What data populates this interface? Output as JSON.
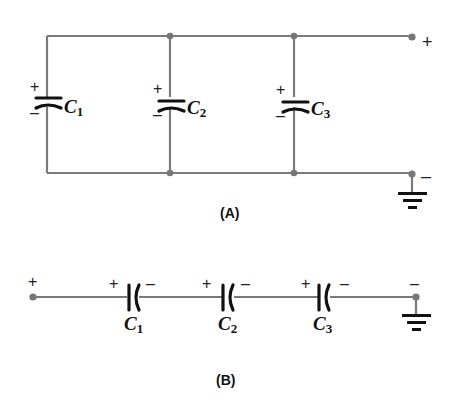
{
  "figures": [
    {
      "id": "A",
      "label": "(A)",
      "configuration": "parallel",
      "capacitors": [
        {
          "name": "C",
          "subscript": "1",
          "plus": "+",
          "minus": "–"
        },
        {
          "name": "C",
          "subscript": "2",
          "plus": "+",
          "minus": "–"
        },
        {
          "name": "C",
          "subscript": "3",
          "plus": "+",
          "minus": "–"
        }
      ],
      "terminals": {
        "top": "+",
        "bottom": "–"
      },
      "ground": true
    },
    {
      "id": "B",
      "label": "(B)",
      "configuration": "series",
      "capacitors": [
        {
          "name": "C",
          "subscript": "1",
          "plus": "+",
          "minus": "–"
        },
        {
          "name": "C",
          "subscript": "2",
          "plus": "+",
          "minus": "–"
        },
        {
          "name": "C",
          "subscript": "3",
          "plus": "+",
          "minus": "–"
        }
      ],
      "terminals": {
        "left": "+",
        "right": "–"
      },
      "ground": true
    }
  ],
  "colors": {
    "wire": "#7a7a7a",
    "plate": "#111111",
    "node": "#777777"
  }
}
